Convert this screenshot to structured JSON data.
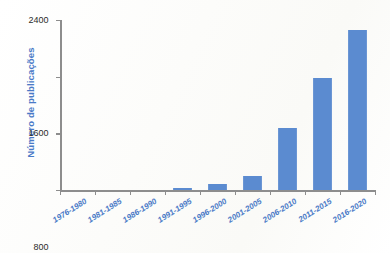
{
  "chart_data": {
    "type": "bar",
    "title": "",
    "subtitle": "",
    "xlabel": "",
    "ylabel": "Número de publicações",
    "categories": [
      "1976-1980",
      "1981-1985",
      "1986-1990",
      "1991-1995",
      "1996-2000",
      "2001-2005",
      "2006-2010",
      "2011-2015",
      "2016-2020"
    ],
    "values": [
      0,
      0,
      0,
      30,
      85,
      195,
      875,
      1580,
      2255
    ],
    "ylim": [
      0,
      2400
    ],
    "yticks": [
      0,
      800,
      1600,
      2400
    ],
    "ytick_labels": [
      "0",
      "800",
      "1600",
      "2400"
    ],
    "grid": false,
    "legend": null,
    "legend_position": "none",
    "series": [
      {
        "name": "Número de publicações",
        "values": [
          0,
          0,
          0,
          30,
          85,
          195,
          875,
          1580,
          2255
        ]
      }
    ],
    "annotations": []
  },
  "style": {
    "bar_color": "#5b8bd0",
    "axis_color": "#8d8d8d",
    "label_color": "#4a7ac7",
    "tick_text_color": "#2b2b2b",
    "background": "#fdfdfc"
  }
}
